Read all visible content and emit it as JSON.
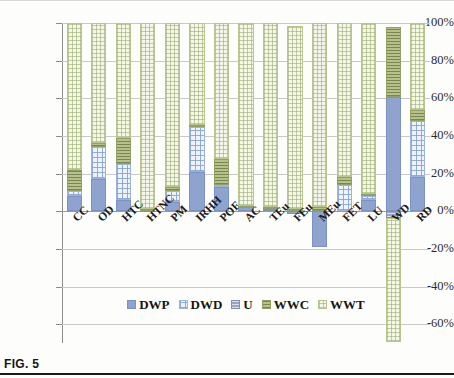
{
  "figure": {
    "caption": "FIG. 5"
  },
  "chart_data": {
    "type": "bar",
    "stacked": true,
    "title": "",
    "xlabel": "",
    "ylabel": "",
    "ylim": [
      -70,
      100
    ],
    "grid": true,
    "legend_position": "bottom",
    "ytick_labels": [
      "100%",
      "80%",
      "60%",
      "40%",
      "20%",
      "0%",
      "-20%",
      "-40%",
      "-60%"
    ],
    "ytick_values": [
      100,
      80,
      60,
      40,
      20,
      0,
      -20,
      -40,
      -60
    ],
    "categories": [
      "CC",
      "OD",
      "HTC",
      "HTNC",
      "PM",
      "IRHH",
      "POF",
      "AC",
      "TEu",
      "FEu",
      "MEu",
      "FET",
      "LU",
      "WD",
      "RD"
    ],
    "series": [
      {
        "name": "DWP",
        "color": "#8ea3ce",
        "values": [
          8,
          17,
          6,
          0.5,
          5,
          21,
          13,
          2,
          1,
          -1.5,
          -19,
          0,
          6,
          60.5,
          18
        ]
      },
      {
        "name": "DWD",
        "color": "#eef3fb",
        "values": [
          3,
          17,
          19,
          0,
          6,
          24,
          1,
          0,
          0,
          0,
          0,
          14,
          2,
          0,
          30
        ]
      },
      {
        "name": "U",
        "color": "#9aa3c4",
        "values": [
          0,
          0,
          0,
          0,
          0,
          0,
          0,
          0,
          0,
          0,
          0,
          0,
          0,
          -3.5,
          0
        ]
      },
      {
        "name": "WWC",
        "color": "#b7c28a",
        "values": [
          11,
          2,
          14,
          0.5,
          2,
          1,
          14,
          1,
          1,
          1,
          2,
          4,
          1,
          37.5,
          6
        ]
      },
      {
        "name": "WWT",
        "color": "#f4f6ea",
        "values": [
          78,
          64,
          61,
          99,
          87,
          54,
          72,
          97,
          98,
          97.5,
          98,
          82,
          91,
          -66,
          46
        ]
      }
    ]
  },
  "legend": {
    "items": [
      {
        "label": "DWP",
        "key": "DWP"
      },
      {
        "label": "DWD",
        "key": "DWD"
      },
      {
        "label": "U",
        "key": "U"
      },
      {
        "label": "WWC",
        "key": "WWC"
      },
      {
        "label": "WWT",
        "key": "WWT"
      }
    ]
  }
}
